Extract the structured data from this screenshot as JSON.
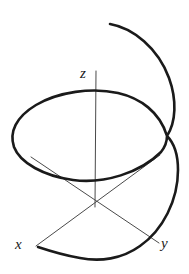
{
  "figure": {
    "width": 189,
    "height": 274,
    "background_color": "#ffffff"
  },
  "axes": {
    "label_x": "x",
    "label_y": "y",
    "label_z": "z",
    "stroke_color": "#4a4a4a",
    "stroke_width": 1,
    "origin": {
      "x": 95,
      "y": 204
    },
    "x_axis": {
      "from": {
        "x": 160,
        "y": 155
      },
      "to": {
        "x": 36,
        "y": 246
      }
    },
    "y_axis": {
      "from": {
        "x": 31,
        "y": 157
      },
      "to": {
        "x": 159,
        "y": 243
      }
    },
    "z_axis": {
      "from": {
        "x": 96,
        "y": 71
      },
      "to": {
        "x": 95,
        "y": 207
      }
    }
  },
  "curve": {
    "name": "helix",
    "stroke_color": "#1a1a1a",
    "stroke_width": 2.6,
    "turns": 1.5,
    "start_point": {
      "x": 110,
      "y": 24
    },
    "end_point": {
      "x": 38,
      "y": 247
    },
    "self_intersection": {
      "x": 167,
      "y": 136
    },
    "path": "M 110 24 C 133 28, 158 48, 169 78 C 177 100, 176 122, 167 136 C 160 112, 140 98, 118 93 C 92 87, 58 92, 36 105 C 16 117, 9 132, 14 147 C 20 163, 44 176, 73 180 C 104 184, 140 173, 161 152 C 165 147, 167 141, 167 136 C 174 143, 178 156, 178 170 C 178 200, 163 230, 140 246 C 122 259, 100 262, 80 258 C 62 255, 47 250, 38 247"
  },
  "chart_data": {
    "type": "line",
    "xlabel": "x",
    "ylabel": "y",
    "zlabel": "z",
    "grid": false,
    "legend": "none",
    "parametric": {
      "x": "cos(t)",
      "y": "sin(t)",
      "z": "t",
      "t_range": [
        0,
        9.42
      ],
      "t_units": "radians"
    },
    "annotations": [
      "x",
      "y",
      "z"
    ]
  }
}
